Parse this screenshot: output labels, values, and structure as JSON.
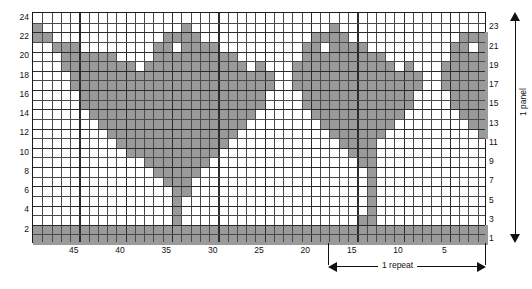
{
  "chart_data": {
    "type": "heatmap",
    "title": "",
    "xlabel": "",
    "ylabel": "",
    "grid": {
      "columns": 49,
      "rows": 24,
      "column_order": "right-to-left",
      "row_order": "bottom-to-top"
    },
    "xlim": [
      1,
      49
    ],
    "ylim": [
      1,
      24
    ],
    "x_tick_labels": [
      "45",
      "40",
      "35",
      "30",
      "25",
      "20",
      "15",
      "10",
      "5"
    ],
    "x_tick_values": [
      45,
      40,
      35,
      30,
      25,
      20,
      15,
      10,
      5
    ],
    "y_tick_labels_left": [
      "24",
      "22",
      "20",
      "18",
      "16",
      "14",
      "12",
      "10",
      "8",
      "6",
      "4",
      "2"
    ],
    "y_tick_values_left": [
      24,
      22,
      20,
      18,
      16,
      14,
      12,
      10,
      8,
      6,
      4,
      2
    ],
    "y_tick_labels_right": [
      "23",
      "21",
      "19",
      "17",
      "15",
      "13",
      "11",
      "9",
      "7",
      "5",
      "3",
      "1"
    ],
    "y_tick_values_right": [
      23,
      21,
      19,
      17,
      15,
      13,
      11,
      9,
      7,
      5,
      3,
      1
    ],
    "legend": [],
    "colors": {
      "filled": "#9a9a9a",
      "empty": "#ffffff",
      "grid_line": "#2b2b2b",
      "border": "#1a1a1a"
    },
    "filled_cells_by_row": {
      "24": [],
      "23": [
        49,
        33,
        17
      ],
      "22": [
        49,
        48,
        35,
        34,
        33,
        32,
        19,
        18,
        17,
        16,
        3,
        2,
        1
      ],
      "21": [
        47,
        46,
        45,
        36,
        35,
        33,
        32,
        31,
        30,
        20,
        19,
        17,
        16,
        15,
        14,
        4,
        3,
        1
      ],
      "20": [
        46,
        45,
        44,
        43,
        42,
        41,
        36,
        35,
        34,
        33,
        32,
        31,
        30,
        29,
        28,
        20,
        19,
        18,
        17,
        16,
        15,
        14,
        13,
        12,
        4,
        3,
        2,
        1
      ],
      "19": [
        46,
        45,
        44,
        43,
        42,
        41,
        40,
        39,
        37,
        36,
        35,
        34,
        33,
        32,
        31,
        30,
        29,
        28,
        27,
        25,
        21,
        20,
        19,
        18,
        17,
        16,
        15,
        14,
        13,
        12,
        11,
        9,
        5,
        4,
        3,
        2,
        1
      ],
      "18": [
        45,
        44,
        43,
        42,
        41,
        40,
        39,
        38,
        37,
        36,
        35,
        34,
        33,
        32,
        31,
        30,
        29,
        28,
        27,
        26,
        25,
        24,
        21,
        20,
        19,
        18,
        17,
        16,
        15,
        14,
        13,
        12,
        11,
        10,
        9,
        8,
        5,
        4,
        3,
        2,
        1
      ],
      "17": [
        45,
        44,
        43,
        42,
        41,
        40,
        39,
        38,
        37,
        36,
        35,
        34,
        33,
        32,
        31,
        30,
        29,
        28,
        27,
        26,
        25,
        24,
        21,
        20,
        19,
        18,
        17,
        16,
        15,
        14,
        13,
        12,
        11,
        10,
        9,
        8,
        5,
        4,
        3,
        2,
        1
      ],
      "16": [
        44,
        43,
        42,
        41,
        40,
        39,
        38,
        37,
        36,
        35,
        34,
        33,
        32,
        31,
        30,
        29,
        28,
        27,
        26,
        25,
        20,
        19,
        18,
        17,
        16,
        15,
        14,
        13,
        12,
        11,
        10,
        9,
        4,
        3,
        2,
        1
      ],
      "15": [
        44,
        43,
        42,
        41,
        40,
        39,
        38,
        37,
        36,
        35,
        34,
        33,
        32,
        31,
        30,
        29,
        28,
        27,
        26,
        25,
        20,
        19,
        18,
        17,
        16,
        15,
        14,
        13,
        12,
        11,
        10,
        9,
        4,
        3,
        2,
        1
      ],
      "14": [
        43,
        42,
        41,
        40,
        39,
        38,
        37,
        36,
        35,
        34,
        33,
        32,
        31,
        30,
        29,
        28,
        27,
        26,
        19,
        18,
        17,
        16,
        15,
        14,
        13,
        12,
        11,
        10,
        3,
        2,
        1
      ],
      "13": [
        42,
        41,
        40,
        39,
        38,
        37,
        36,
        35,
        34,
        33,
        32,
        31,
        30,
        29,
        28,
        27,
        18,
        17,
        16,
        15,
        14,
        13,
        12,
        11,
        2,
        1
      ],
      "12": [
        41,
        40,
        39,
        38,
        37,
        36,
        35,
        34,
        33,
        32,
        31,
        30,
        29,
        28,
        17,
        16,
        15,
        14,
        13,
        12,
        1
      ],
      "11": [
        40,
        39,
        38,
        37,
        36,
        35,
        34,
        33,
        32,
        31,
        30,
        29,
        16,
        15,
        14,
        13
      ],
      "10": [
        39,
        38,
        37,
        36,
        35,
        34,
        33,
        32,
        31,
        30,
        15,
        14,
        13
      ],
      "9": [
        37,
        36,
        35,
        34,
        33,
        32,
        31,
        14,
        13
      ],
      "8": [
        36,
        35,
        34,
        33,
        32,
        13
      ],
      "7": [
        35,
        34,
        33,
        13
      ],
      "6": [
        34,
        33,
        13
      ],
      "5": [
        34,
        13
      ],
      "4": [
        34,
        13
      ],
      "3": [
        34,
        14,
        13
      ],
      "2": "all",
      "1": "all"
    }
  },
  "axes": {
    "left_label_name": "row-numbers-even",
    "right_label_name": "row-numbers-odd",
    "bottom_label_name": "stitch-numbers"
  },
  "annotations": {
    "panel": {
      "label": "1 panel",
      "direction": "vertical-double-arrow"
    },
    "repeat": {
      "label": "1 repeat",
      "direction": "horizontal-double-arrow",
      "span_stitches": [
        1,
        15
      ]
    }
  }
}
